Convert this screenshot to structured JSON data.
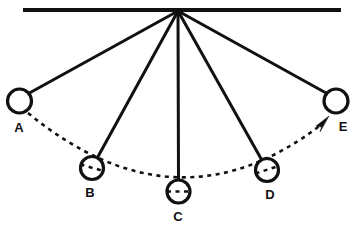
{
  "figure": {
    "line_color": "#111111",
    "background_color": "#ffffff",
    "bob_fill_color": "#ffffff"
  },
  "support": {
    "name": "horizontal support bar",
    "x1": 23,
    "x2": 341,
    "y": 10,
    "thickness": 4
  },
  "pivot": {
    "name": "pivot point",
    "x": 178,
    "y": 11
  },
  "bobs": [
    {
      "label": "A",
      "cx": 19.5,
      "cy": 101,
      "r": 12,
      "label_x": 19,
      "label_y": 132,
      "rod": true,
      "rod_style": "solid"
    },
    {
      "label": "B",
      "cx": 92,
      "cy": 168,
      "r": 11.5,
      "label_x": 90,
      "label_y": 197,
      "rod": true,
      "rod_style": "solid"
    },
    {
      "label": "C",
      "cx": 178.5,
      "cy": 191.5,
      "r": 11.5,
      "label_x": 178,
      "label_y": 221,
      "rod": true,
      "rod_style": "solid"
    },
    {
      "label": "D",
      "cx": 267,
      "cy": 170,
      "r": 11.5,
      "label_x": 270,
      "label_y": 199,
      "rod": true,
      "rod_style": "solid"
    },
    {
      "label": "E",
      "cx": 336,
      "cy": 101,
      "r": 12,
      "label_x": 343,
      "label_y": 131,
      "rod": true,
      "rod_style": "solid"
    }
  ],
  "arc": {
    "name": "dashed trajectory arc",
    "style": "dashed",
    "start_x": 28,
    "start_y": 113,
    "end_x": 322,
    "end_y": 124,
    "control_x": 178,
    "control_y": 236
  },
  "arrow": {
    "name": "direction of motion arrow",
    "tip_x": 328,
    "tip_y": 117,
    "angle_deg": -45,
    "points_toward": "E"
  }
}
